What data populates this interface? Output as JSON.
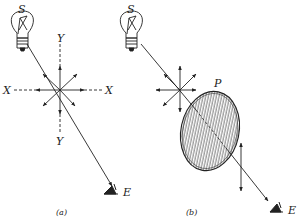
{
  "figure": {
    "panels": [
      {
        "id": "a",
        "caption": "(a)",
        "source_label": "S",
        "eye_label": "E",
        "axis_labels": {
          "x_left": "X",
          "x_right": "X",
          "y_top": "Y",
          "y_bottom": "Y"
        }
      },
      {
        "id": "b",
        "caption": "(b)",
        "source_label": "S",
        "eye_label": "E",
        "polarizer_label": "P"
      }
    ],
    "colors": {
      "ink": "#222222",
      "background": "#ffffff"
    }
  }
}
